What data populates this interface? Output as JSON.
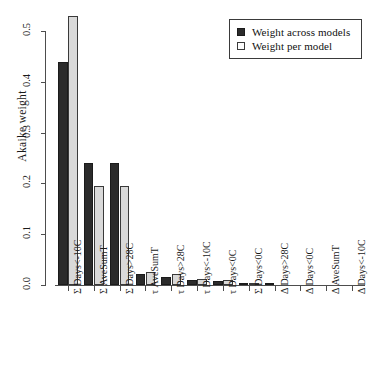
{
  "chart_data": {
    "type": "bar",
    "title": "",
    "subtitle": "",
    "xlabel": "",
    "ylabel": "Akaike weight",
    "ylim": [
      0.0,
      0.5
    ],
    "yticks": [
      "0.0",
      "0.1",
      "0.2",
      "0.3",
      "0.4",
      "0.5"
    ],
    "ytick_values": [
      0.0,
      0.1,
      0.2,
      0.3,
      0.4,
      0.5
    ],
    "grid": false,
    "legend_position": "top-right",
    "categories": [
      "Σ Days<-10C",
      "Σ AveSumT",
      "Σ Days>28C",
      "τ AveSumT",
      "τ Days>28C",
      "τ Days<-10C",
      "τ Days<0C",
      "Σ Days<0C",
      "Δ Days>28C",
      "Δ Days<0C",
      "Δ AveSumT",
      "Δ Days<-10C"
    ],
    "series": [
      {
        "name": "Weight across models",
        "color": "#2b2b2b",
        "values": [
          0.44,
          0.24,
          0.24,
          0.021,
          0.016,
          0.009,
          0.007,
          0.004,
          0.001,
          0.0,
          0.0,
          0.0
        ]
      },
      {
        "name": "Weight per model",
        "color": "#d9d9d9",
        "values": [
          0.53,
          0.195,
          0.194,
          0.025,
          0.022,
          0.012,
          0.009,
          0.003,
          0.0,
          0.0,
          0.0,
          0.0
        ]
      }
    ]
  },
  "legend": {
    "items": [
      {
        "label": "Weight across models",
        "swatch": "dark"
      },
      {
        "label": "Weight per model",
        "swatch": "light"
      }
    ]
  }
}
